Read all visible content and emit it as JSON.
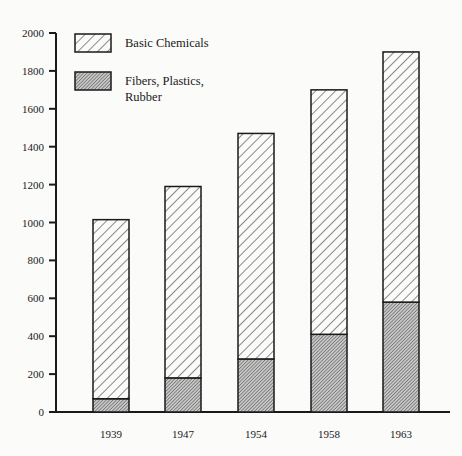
{
  "chart_data": {
    "type": "bar",
    "stacked": true,
    "title": "",
    "xlabel": "",
    "ylabel": "",
    "ylim": [
      0,
      2000
    ],
    "yticks": [
      0,
      200,
      400,
      600,
      800,
      1000,
      1200,
      1400,
      1600,
      1800,
      2000
    ],
    "categories": [
      "1939",
      "1947",
      "1954",
      "1958",
      "1963"
    ],
    "series": [
      {
        "name": "Fibers, Plastics, Rubber",
        "values": [
          70,
          180,
          280,
          410,
          580
        ],
        "pattern": "dense-hatch-gray"
      },
      {
        "name": "Basic Chemicals",
        "values": [
          945,
          1010,
          1190,
          1290,
          1320
        ],
        "pattern": "sparse-diagonal-hatch"
      }
    ],
    "totals": [
      1015,
      1190,
      1470,
      1700,
      1900
    ],
    "grid": false,
    "legend_position": "upper-left-inside"
  },
  "legend": {
    "items": [
      {
        "label_lines": [
          "Basic Chemicals"
        ],
        "pattern": "sparse"
      },
      {
        "label_lines": [
          "Fibers, Plastics,",
          "Rubber"
        ],
        "pattern": "dense"
      }
    ]
  },
  "colors": {
    "ink": "#1a1a1a",
    "background": "#fbfbf9",
    "dense_fill": "#9a9a9a"
  }
}
